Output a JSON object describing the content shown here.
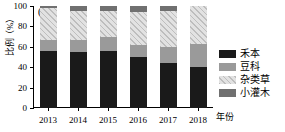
{
  "panel": {
    "label": "(b)"
  },
  "axes": {
    "ylabel": "比例（%）",
    "xlabel": "年份",
    "yticks": [
      "0",
      "20",
      "40",
      "60",
      "80",
      "100"
    ],
    "xticks": [
      "2013",
      "2014",
      "2015",
      "2016",
      "2017",
      "2018"
    ]
  },
  "legend": {
    "items": [
      {
        "label": "禾本",
        "color": "#1a1a1a"
      },
      {
        "label": "豆科",
        "color": "#9a9a9a"
      },
      {
        "label": "杂类草",
        "color": "#e2e2e2"
      },
      {
        "label": "小灌木",
        "color": "#707070"
      }
    ]
  },
  "chart_data": {
    "type": "bar",
    "stacked": true,
    "title": "(b)",
    "xlabel": "年份",
    "ylabel": "比例（%）",
    "categories": [
      "2013",
      "2014",
      "2015",
      "2016",
      "2017",
      "2018"
    ],
    "ylim": [
      0,
      100
    ],
    "yticks": [
      0,
      20,
      40,
      60,
      80,
      100
    ],
    "grid": false,
    "legend_position": "right",
    "series": [
      {
        "name": "禾本",
        "color": "#1a1a1a",
        "values": [
          56,
          55,
          56,
          50,
          44,
          40
        ]
      },
      {
        "name": "豆科",
        "color": "#9a9a9a",
        "values": [
          11,
          12,
          14,
          12,
          16,
          23
        ]
      },
      {
        "name": "杂类草",
        "color": "#e2e2e2",
        "values": [
          31,
          28,
          25,
          32,
          35,
          37
        ]
      },
      {
        "name": "小灌木",
        "color": "#707070",
        "values": [
          2,
          5,
          5,
          6,
          5,
          0
        ]
      }
    ]
  }
}
